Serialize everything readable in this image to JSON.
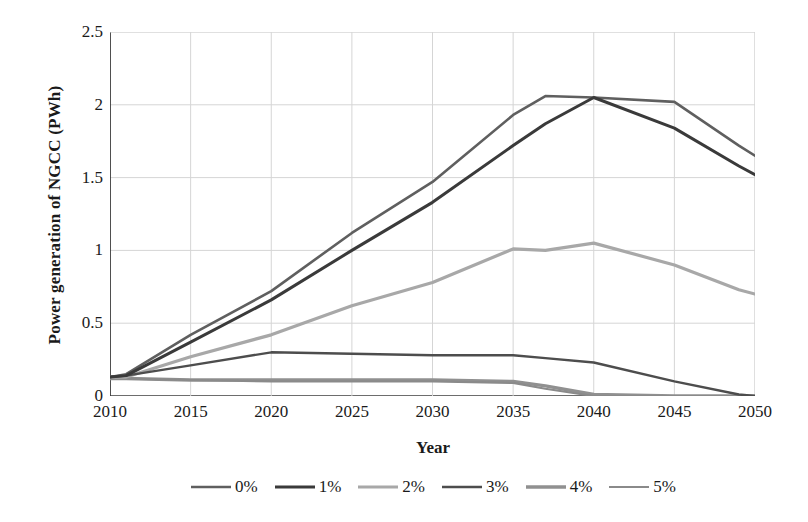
{
  "chart_data": {
    "type": "line",
    "title": "",
    "xlabel": "Year",
    "ylabel": "Power generation of NGCC (PWh)",
    "xlim": [
      2010,
      2050
    ],
    "ylim": [
      0,
      2.5
    ],
    "xticks": [
      "2010",
      "2015",
      "2020",
      "2025",
      "2030",
      "2035",
      "2040",
      "2045",
      "2050"
    ],
    "yticks": [
      "0",
      "0.5",
      "1",
      "1.5",
      "2",
      "2.5"
    ],
    "grid": true,
    "legend_position": "bottom",
    "x": [
      2010,
      2011,
      2015,
      2020,
      2025,
      2030,
      2035,
      2037,
      2040,
      2045,
      2049,
      2050
    ],
    "series": [
      {
        "name": "0%",
        "color": "#5f5f5f",
        "width": 2.6,
        "values": [
          0.13,
          0.15,
          0.42,
          0.72,
          1.12,
          1.47,
          1.93,
          2.06,
          2.05,
          2.02,
          1.72,
          1.65
        ]
      },
      {
        "name": "1%",
        "color": "#3a3a3a",
        "width": 3.0,
        "values": [
          0.13,
          0.14,
          0.37,
          0.66,
          1.0,
          1.33,
          1.72,
          1.87,
          2.05,
          1.84,
          1.58,
          1.52
        ]
      },
      {
        "name": "2%",
        "color": "#a8a8a8",
        "width": 3.2,
        "values": [
          0.13,
          0.13,
          0.27,
          0.42,
          0.62,
          0.78,
          1.01,
          1.0,
          1.05,
          0.9,
          0.73,
          0.7
        ]
      },
      {
        "name": "3%",
        "color": "#4d4d4d",
        "width": 2.4,
        "values": [
          0.13,
          0.14,
          0.21,
          0.3,
          0.29,
          0.28,
          0.28,
          0.26,
          0.23,
          0.1,
          0.01,
          0.0
        ]
      },
      {
        "name": "4%",
        "color": "#909090",
        "width": 3.4,
        "values": [
          0.12,
          0.12,
          0.11,
          0.11,
          0.11,
          0.11,
          0.1,
          0.07,
          0.01,
          0.0,
          0.0,
          0.0
        ]
      },
      {
        "name": "5%",
        "color": "#8a8a8a",
        "width": 2.2,
        "values": [
          0.12,
          0.12,
          0.11,
          0.1,
          0.1,
          0.1,
          0.09,
          0.05,
          0.0,
          0.0,
          0.0,
          0.0
        ]
      }
    ]
  }
}
